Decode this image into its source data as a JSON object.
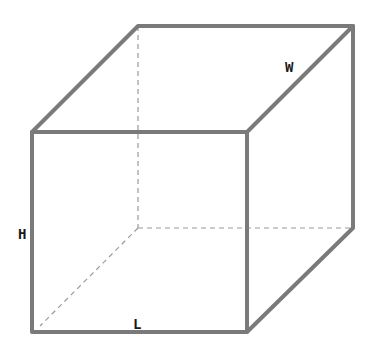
{
  "diagram": {
    "type": "cuboid-wireframe",
    "labels": {
      "height": "H",
      "length": "L",
      "width": "W"
    },
    "colors": {
      "edge": "#7a7a7a",
      "hidden_edge": "#9a9a9a",
      "label": "#1a1a1a",
      "background": "#ffffff"
    }
  }
}
